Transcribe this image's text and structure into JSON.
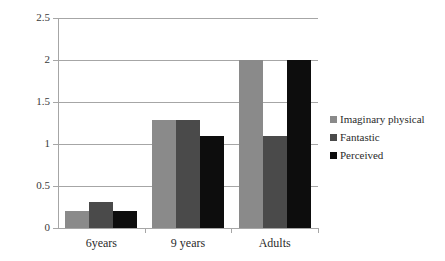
{
  "chart_data": {
    "type": "bar",
    "title": "",
    "xlabel": "",
    "ylabel": "",
    "categories": [
      "6years",
      "9 years",
      "Adults"
    ],
    "series": [
      {
        "name": "Imaginary physical",
        "color": "#8a8a8a",
        "values": [
          0.2,
          1.29,
          2.0
        ]
      },
      {
        "name": "Fantastic",
        "color": "#4a4a4a",
        "values": [
          0.31,
          1.28,
          1.1
        ]
      },
      {
        "name": "Perceived",
        "color": "#0d0d0d",
        "values": [
          0.2,
          1.09,
          2.0
        ]
      }
    ],
    "ylim": [
      0,
      2.5
    ],
    "y_ticks": [
      "0",
      "0.5",
      "1",
      "1.5",
      "2",
      "2.5"
    ],
    "y_tick_values": [
      0,
      0.5,
      1,
      1.5,
      2,
      2.5
    ],
    "grid": true,
    "legend_position": "right"
  }
}
